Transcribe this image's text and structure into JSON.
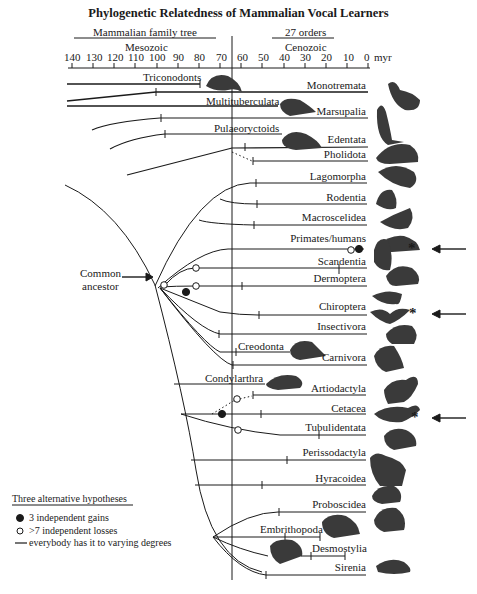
{
  "title": "Phylogenetic Relatedness of Mammalian Vocal Learners",
  "headers": {
    "family_tree": "Mammalian family tree",
    "orders": "27 orders",
    "mesozoic": "Mesozoic",
    "cenozoic": "Cenozoic",
    "unit": "myr"
  },
  "axis_ticks": [
    "140",
    "130",
    "120",
    "110",
    "100",
    "90",
    "80",
    "70",
    "60",
    "50",
    "40",
    "30",
    "20",
    "10",
    "0"
  ],
  "common_ancestor": [
    "Common",
    "ancestor"
  ],
  "extinct_groups": {
    "triconodonts": "Triconodonts",
    "multituberculata": "Multituberculata",
    "pulaeoryctoids": "Pulaeoryctoids",
    "creodonta": "Creodonta",
    "condylarthra": "Condylarthra",
    "embrithopoda": "Embrithopoda",
    "desmostylia": "Desmostylia"
  },
  "orders": [
    {
      "name": "Monotremata",
      "vocal_learner": false
    },
    {
      "name": "Marsupalia",
      "vocal_learner": false
    },
    {
      "name": "Edentata",
      "vocal_learner": false
    },
    {
      "name": "Pholidota",
      "vocal_learner": false
    },
    {
      "name": "Lagomorpha",
      "vocal_learner": false
    },
    {
      "name": "Rodentia",
      "vocal_learner": false
    },
    {
      "name": "Macroscelidea",
      "vocal_learner": false
    },
    {
      "name": "Primates/humans",
      "vocal_learner": true
    },
    {
      "name": "Scandentia",
      "vocal_learner": false
    },
    {
      "name": "Dermoptera",
      "vocal_learner": false
    },
    {
      "name": "Chiroptera",
      "vocal_learner": true
    },
    {
      "name": "Insectivora",
      "vocal_learner": false
    },
    {
      "name": "Carnivora",
      "vocal_learner": false
    },
    {
      "name": "Artiodactyla",
      "vocal_learner": false
    },
    {
      "name": "Cetacea",
      "vocal_learner": true
    },
    {
      "name": "Tubulidentata",
      "vocal_learner": false
    },
    {
      "name": "Perissodactyla",
      "vocal_learner": false
    },
    {
      "name": "Hyracoidea",
      "vocal_learner": false
    },
    {
      "name": "Proboscidea",
      "vocal_learner": false
    },
    {
      "name": "Sirenia",
      "vocal_learner": false
    }
  ],
  "markers": {
    "star": "*"
  },
  "legend": {
    "title": "Three alternative hypotheses",
    "items": [
      {
        "symbol": "filled-circle",
        "label": "3 independent gains"
      },
      {
        "symbol": "open-circle",
        "label": ">7 independent losses"
      },
      {
        "symbol": "line",
        "label": "everybody has it to varying degrees"
      }
    ]
  },
  "colors": {
    "ink": "#1a1a1a",
    "background": "#ffffff",
    "silhouette": "#3a3a3a"
  }
}
